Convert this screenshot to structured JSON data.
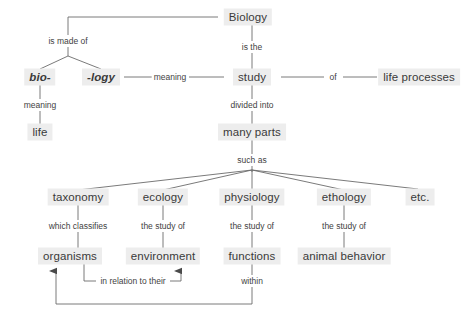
{
  "diagram": {
    "colors": {
      "node_bg": "#ededed",
      "node_text": "#3a3a3a",
      "line": "#6b6b6b",
      "label_text": "#3f3f3f",
      "background": "#ffffff"
    },
    "nodes": [
      {
        "id": "biology",
        "label": "Biology",
        "x": 248,
        "y": 17,
        "style": "big"
      },
      {
        "id": "bio",
        "label": "bio-",
        "x": 40,
        "y": 77,
        "style": "ital"
      },
      {
        "id": "logy",
        "label": "-logy",
        "x": 101,
        "y": 77,
        "style": "ital"
      },
      {
        "id": "study",
        "label": "study",
        "x": 252,
        "y": 77,
        "style": "big"
      },
      {
        "id": "life-processes",
        "label": "life processes",
        "x": 419,
        "y": 77,
        "style": "big"
      },
      {
        "id": "life",
        "label": "life",
        "x": 40,
        "y": 132,
        "style": "big"
      },
      {
        "id": "many-parts",
        "label": "many parts",
        "x": 252,
        "y": 132,
        "style": "big"
      },
      {
        "id": "taxonomy",
        "label": "taxonomy",
        "x": 78,
        "y": 197,
        "style": "big"
      },
      {
        "id": "ecology",
        "label": "ecology",
        "x": 163,
        "y": 197,
        "style": "big"
      },
      {
        "id": "physiology",
        "label": "physiology",
        "x": 252,
        "y": 197,
        "style": "big"
      },
      {
        "id": "ethology",
        "label": "ethology",
        "x": 344,
        "y": 197,
        "style": "big"
      },
      {
        "id": "etc",
        "label": "etc.",
        "x": 420,
        "y": 197,
        "style": "big"
      },
      {
        "id": "organisms",
        "label": "organisms",
        "x": 70,
        "y": 256,
        "style": "big"
      },
      {
        "id": "environment",
        "label": "environment",
        "x": 163,
        "y": 256,
        "style": "big"
      },
      {
        "id": "functions",
        "label": "functions",
        "x": 252,
        "y": 256,
        "style": "big"
      },
      {
        "id": "animal-behavior",
        "label": "animal behavior",
        "x": 344,
        "y": 256,
        "style": "big"
      }
    ],
    "link_labels": [
      {
        "id": "is-made-of",
        "label": "is made of",
        "x": 68,
        "y": 41
      },
      {
        "id": "is-the",
        "label": "is the",
        "x": 252,
        "y": 47
      },
      {
        "id": "meaning-logy",
        "label": "meaning",
        "x": 170,
        "y": 77
      },
      {
        "id": "of",
        "label": "of",
        "x": 333,
        "y": 77
      },
      {
        "id": "meaning-bio",
        "label": "meaning",
        "x": 40,
        "y": 105
      },
      {
        "id": "divided-into",
        "label": "divided into",
        "x": 252,
        "y": 105
      },
      {
        "id": "such-as",
        "label": "such as",
        "x": 252,
        "y": 160
      },
      {
        "id": "which-classifies",
        "label": "which classifies",
        "x": 78,
        "y": 226
      },
      {
        "id": "the-study-of-eco",
        "label": "the study of",
        "x": 163,
        "y": 226
      },
      {
        "id": "the-study-of-phys",
        "label": "the study of",
        "x": 252,
        "y": 226
      },
      {
        "id": "the-study-of-etho",
        "label": "the study of",
        "x": 344,
        "y": 226
      },
      {
        "id": "in-relation-to-their",
        "label": "in relation to their",
        "x": 133,
        "y": 281
      },
      {
        "id": "within",
        "label": "within",
        "x": 252,
        "y": 281
      }
    ],
    "edges": [
      {
        "id": "biology-to-is-made-of",
        "from": "biology",
        "to": "is-made-of",
        "kind": "elbow"
      },
      {
        "id": "is-made-of-to-bio",
        "from": "is-made-of",
        "to": "bio",
        "kind": "diagonal"
      },
      {
        "id": "is-made-of-to-logy",
        "from": "is-made-of",
        "to": "logy",
        "kind": "diagonal"
      },
      {
        "id": "biology-to-study",
        "from": "biology",
        "to": "study",
        "kind": "vertical"
      },
      {
        "id": "logy-to-study",
        "from": "logy",
        "to": "study",
        "kind": "horizontal"
      },
      {
        "id": "study-to-life-processes",
        "from": "study",
        "to": "life-processes",
        "kind": "horizontal"
      },
      {
        "id": "bio-to-life",
        "from": "bio",
        "to": "life",
        "kind": "vertical"
      },
      {
        "id": "study-to-many-parts",
        "from": "study",
        "to": "many-parts",
        "kind": "vertical"
      },
      {
        "id": "many-parts-to-such-as",
        "from": "many-parts",
        "to": "such-as",
        "kind": "vertical"
      },
      {
        "id": "such-as-to-taxonomy",
        "from": "such-as",
        "to": "taxonomy",
        "kind": "diagonal"
      },
      {
        "id": "such-as-to-ecology",
        "from": "such-as",
        "to": "ecology",
        "kind": "diagonal"
      },
      {
        "id": "such-as-to-physiology",
        "from": "such-as",
        "to": "physiology",
        "kind": "vertical"
      },
      {
        "id": "such-as-to-ethology",
        "from": "such-as",
        "to": "ethology",
        "kind": "diagonal"
      },
      {
        "id": "such-as-to-etc",
        "from": "such-as",
        "to": "etc",
        "kind": "diagonal"
      },
      {
        "id": "taxonomy-to-organisms",
        "from": "taxonomy",
        "to": "organisms",
        "kind": "vertical"
      },
      {
        "id": "ecology-to-environment",
        "from": "ecology",
        "to": "environment",
        "kind": "vertical"
      },
      {
        "id": "physiology-to-functions",
        "from": "physiology",
        "to": "functions",
        "kind": "vertical"
      },
      {
        "id": "ethology-to-animal-behavior",
        "from": "ethology",
        "to": "animal-behavior",
        "kind": "vertical"
      },
      {
        "id": "organisms-to-environment",
        "from": "organisms",
        "to": "environment",
        "kind": "elbow-arrow"
      },
      {
        "id": "functions-to-organisms",
        "from": "functions",
        "to": "organisms",
        "kind": "elbow-arrow"
      }
    ]
  }
}
